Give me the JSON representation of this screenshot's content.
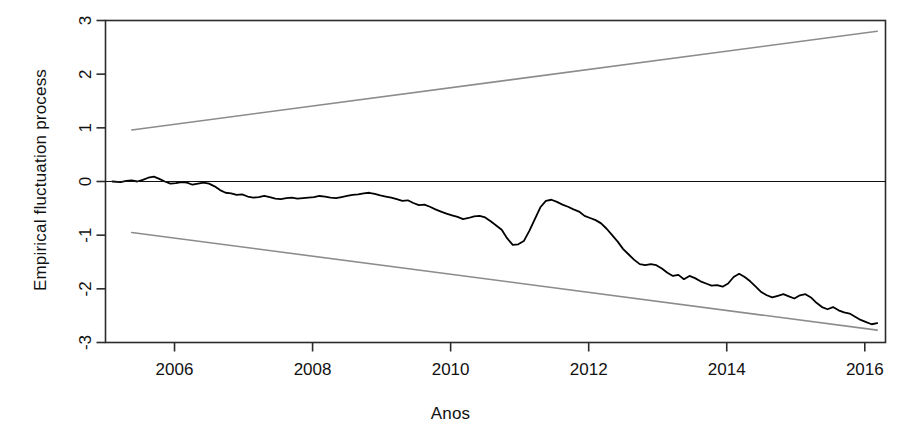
{
  "chart_data": {
    "type": "line",
    "title": "",
    "xlabel": "Anos",
    "ylabel": "Empirical fluctuation process",
    "xlim": [
      2005.0,
      2016.3
    ],
    "ylim": [
      -3.0,
      3.0
    ],
    "grid": false,
    "legend": "none",
    "x_ticks": [
      2006,
      2008,
      2010,
      2012,
      2014,
      2016
    ],
    "x_tick_labels": [
      "2006",
      "2008",
      "2010",
      "2012",
      "2014",
      "2016"
    ],
    "y_ticks": [
      -3,
      -2,
      -1,
      0,
      1,
      2,
      3
    ],
    "y_tick_labels": [
      "-3",
      "-2",
      "-1",
      "0",
      "1",
      "2",
      "3"
    ],
    "series": [
      {
        "name": "Empirical fluctuation process",
        "role": "cusum-path",
        "color": "#000000",
        "width": 1.8,
        "x": [
          2005.1,
          2005.22,
          2005.3,
          2005.38,
          2005.46,
          2005.54,
          2005.62,
          2005.7,
          2005.78,
          2005.86,
          2005.94,
          2006.02,
          2006.1,
          2006.18,
          2006.26,
          2006.34,
          2006.42,
          2006.5,
          2006.58,
          2006.66,
          2006.74,
          2006.82,
          2006.9,
          2006.98,
          2007.06,
          2007.14,
          2007.22,
          2007.3,
          2007.38,
          2007.46,
          2007.54,
          2007.62,
          2007.7,
          2007.78,
          2007.86,
          2007.94,
          2008.02,
          2008.1,
          2008.18,
          2008.26,
          2008.34,
          2008.42,
          2008.5,
          2008.58,
          2008.66,
          2008.74,
          2008.82,
          2008.9,
          2008.98,
          2009.06,
          2009.14,
          2009.22,
          2009.3,
          2009.38,
          2009.46,
          2009.54,
          2009.62,
          2009.7,
          2009.78,
          2009.86,
          2009.94,
          2010.02,
          2010.1,
          2010.18,
          2010.26,
          2010.34,
          2010.42,
          2010.5,
          2010.58,
          2010.66,
          2010.74,
          2010.82,
          2010.9,
          2010.98,
          2011.06,
          2011.14,
          2011.22,
          2011.3,
          2011.38,
          2011.46,
          2011.54,
          2011.62,
          2011.7,
          2011.78,
          2011.86,
          2011.94,
          2012.02,
          2012.1,
          2012.18,
          2012.26,
          2012.34,
          2012.42,
          2012.5,
          2012.58,
          2012.66,
          2012.74,
          2012.82,
          2012.9,
          2012.98,
          2013.06,
          2013.14,
          2013.22,
          2013.3,
          2013.38,
          2013.46,
          2013.54,
          2013.62,
          2013.7,
          2013.78,
          2013.86,
          2013.94,
          2014.02,
          2014.1,
          2014.18,
          2014.26,
          2014.34,
          2014.42,
          2014.5,
          2014.58,
          2014.66,
          2014.74,
          2014.82,
          2014.9,
          2014.98,
          2015.06,
          2015.14,
          2015.22,
          2015.3,
          2015.38,
          2015.46,
          2015.54,
          2015.62,
          2015.7,
          2015.78,
          2015.86,
          2015.94,
          2016.02,
          2016.1,
          2016.18
        ],
        "y": [
          0.0,
          -0.01,
          0.01,
          0.02,
          0.0,
          0.03,
          0.07,
          0.09,
          0.05,
          0.0,
          -0.04,
          -0.03,
          -0.01,
          -0.02,
          -0.06,
          -0.04,
          -0.02,
          -0.04,
          -0.09,
          -0.16,
          -0.21,
          -0.22,
          -0.25,
          -0.24,
          -0.28,
          -0.3,
          -0.29,
          -0.27,
          -0.29,
          -0.32,
          -0.33,
          -0.31,
          -0.3,
          -0.32,
          -0.31,
          -0.3,
          -0.29,
          -0.27,
          -0.28,
          -0.3,
          -0.31,
          -0.29,
          -0.27,
          -0.25,
          -0.24,
          -0.22,
          -0.21,
          -0.23,
          -0.26,
          -0.28,
          -0.3,
          -0.33,
          -0.36,
          -0.35,
          -0.4,
          -0.44,
          -0.43,
          -0.47,
          -0.52,
          -0.56,
          -0.6,
          -0.63,
          -0.66,
          -0.7,
          -0.68,
          -0.65,
          -0.64,
          -0.67,
          -0.74,
          -0.82,
          -0.9,
          -1.06,
          -1.18,
          -1.17,
          -1.11,
          -0.92,
          -0.7,
          -0.48,
          -0.36,
          -0.34,
          -0.38,
          -0.43,
          -0.47,
          -0.52,
          -0.56,
          -0.64,
          -0.68,
          -0.72,
          -0.78,
          -0.88,
          -1.0,
          -1.12,
          -1.26,
          -1.36,
          -1.46,
          -1.54,
          -1.56,
          -1.54,
          -1.56,
          -1.62,
          -1.7,
          -1.76,
          -1.74,
          -1.82,
          -1.76,
          -1.8,
          -1.86,
          -1.9,
          -1.94,
          -1.93,
          -1.96,
          -1.9,
          -1.78,
          -1.72,
          -1.78,
          -1.86,
          -1.96,
          -2.06,
          -2.12,
          -2.16,
          -2.13,
          -2.1,
          -2.14,
          -2.18,
          -2.12,
          -2.1,
          -2.16,
          -2.26,
          -2.34,
          -2.38,
          -2.34,
          -2.4,
          -2.44,
          -2.46,
          -2.52,
          -2.58,
          -2.62,
          -2.66,
          -2.64
        ]
      },
      {
        "name": "Upper boundary",
        "role": "boundary-upper",
        "color": "#8c8c8c",
        "width": 1.6,
        "x": [
          2005.38,
          2016.18
        ],
        "y": [
          0.96,
          2.8
        ]
      },
      {
        "name": "Lower boundary",
        "role": "boundary-lower",
        "color": "#8c8c8c",
        "width": 1.6,
        "x": [
          2005.38,
          2016.18
        ],
        "y": [
          -0.95,
          -2.77
        ]
      },
      {
        "name": "Zero reference line",
        "role": "zero-line",
        "color": "#111111",
        "width": 1.2,
        "x": [
          2005.0,
          2016.3
        ],
        "y": [
          0.0,
          0.0
        ]
      }
    ]
  },
  "axis": {
    "x_label": "Anos",
    "y_label": "Empirical fluctuation process"
  }
}
